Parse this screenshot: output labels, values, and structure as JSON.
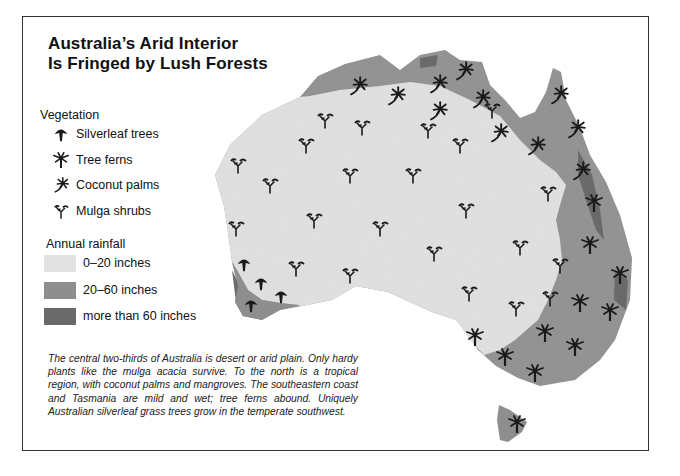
{
  "title": {
    "line1": "Australia’s Arid Interior",
    "line2": "Is Fringed by Lush Forests"
  },
  "legend": {
    "vegetation": {
      "heading": "Vegetation",
      "items": [
        {
          "icon": "silverleaf-tree-icon",
          "label": "Silverleaf trees"
        },
        {
          "icon": "tree-fern-icon",
          "label": "Tree ferns"
        },
        {
          "icon": "coconut-palm-icon",
          "label": "Coconut palms"
        },
        {
          "icon": "mulga-shrub-icon",
          "label": "Mulga shrubs"
        }
      ]
    },
    "rainfall": {
      "heading": "Annual rainfall",
      "items": [
        {
          "label": "0–20 inches",
          "color": "#e2e2e2"
        },
        {
          "label": "20–60 inches",
          "color": "#8e8e8e"
        },
        {
          "label": "more than 60 inches",
          "color": "#6a6a6a"
        }
      ]
    }
  },
  "caption": "The central two-thirds of Australia is desert or arid plain. Only hardy plants like the mulga acacia survive. To the north is a tropical region, with coconut palms and man­groves. The southeastern coast and Tasmania are mild and wet; tree ferns abound. Uniquely Australian silver­leaf grass trees grow in the temperate southwest.",
  "colors": {
    "arid": "#e2e2e2",
    "moderate": "#8e8e8e",
    "wet": "#6a6a6a",
    "icon": "#1a1a1a",
    "frame": "#333333"
  }
}
